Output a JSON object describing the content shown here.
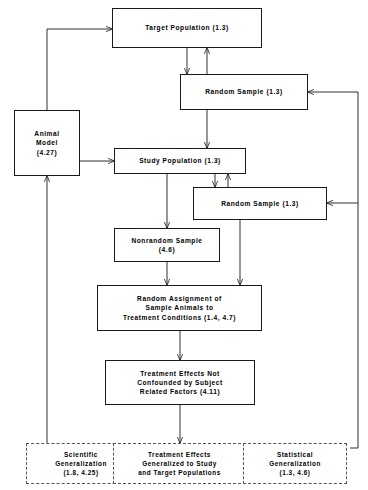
{
  "diagram": {
    "background_color": "#ffffff",
    "line_color": "#1a1a1a",
    "dashed_border_color": "#555555",
    "nodes": [
      {
        "id": "target-population",
        "label": "Target  Population  (1.3)",
        "style": "solid",
        "x": 112,
        "y": 8,
        "w": 150,
        "h": 40
      },
      {
        "id": "random-sample-top",
        "label": "Random  Sample  (1.3)",
        "style": "solid",
        "x": 180,
        "y": 74,
        "w": 128,
        "h": 36
      },
      {
        "id": "animal-model",
        "label": "Animal\nModel\n(4.27)",
        "style": "solid",
        "x": 14,
        "y": 110,
        "w": 66,
        "h": 66
      },
      {
        "id": "study-population",
        "label": "Study  Population  (1.3)",
        "style": "solid",
        "x": 114,
        "y": 148,
        "w": 132,
        "h": 26
      },
      {
        "id": "random-sample-lower",
        "label": "Random  Sample  (1.3)",
        "style": "solid",
        "x": 193,
        "y": 187,
        "w": 134,
        "h": 33
      },
      {
        "id": "nonrandom-sample",
        "label": "Nonrandom  Sample\n(4.6)",
        "style": "solid",
        "x": 114,
        "y": 228,
        "w": 106,
        "h": 34
      },
      {
        "id": "random-assignment",
        "label": "Random  Assignment  of\nSample  Animals  to\nTreatment  Conditions  (1.4,  4.7)",
        "style": "solid",
        "x": 97,
        "y": 285,
        "w": 165,
        "h": 46
      },
      {
        "id": "treatment-effects-not-confounded",
        "label": "Treatment  Effects  Not\nConfounded  by  Subject\nRelated  Factors  (4.11)",
        "style": "solid",
        "x": 105,
        "y": 360,
        "w": 150,
        "h": 45
      },
      {
        "id": "scientific-generalization",
        "label": "Scientific\nGeneralization\n(1.8,  4.25)",
        "style": "dashed",
        "x": 26,
        "y": 443,
        "w": 110,
        "h": 41
      },
      {
        "id": "treatment-effects-generalized",
        "label": "Treatment  Effects\nGeneralized  to  Study\nand  Target  Populations",
        "style": "dashed",
        "x": 113,
        "y": 443,
        "w": 133,
        "h": 41
      },
      {
        "id": "statistical-generalization",
        "label": "Statistical\nGeneralization\n(1.3,  4.6)",
        "style": "dashed",
        "x": 243,
        "y": 443,
        "w": 104,
        "h": 41
      }
    ],
    "connectors": [
      {
        "id": "target-to-random-sample-top",
        "from": "target-population",
        "to": "random-sample-top",
        "direction": "down"
      },
      {
        "id": "random-sample-top-to-target",
        "from": "random-sample-top",
        "to": "target-population",
        "direction": "up"
      },
      {
        "id": "animal-model-to-target",
        "from": "animal-model",
        "to": "target-population",
        "direction": "up-left-elbow"
      },
      {
        "id": "animal-model-to-study-population",
        "from": "animal-model",
        "to": "study-population",
        "direction": "right"
      },
      {
        "id": "random-sample-top-to-study-population",
        "from": "random-sample-top",
        "to": "study-population",
        "direction": "down"
      },
      {
        "id": "study-population-to-random-sample-lower",
        "from": "study-population",
        "to": "random-sample-lower",
        "direction": "down"
      },
      {
        "id": "random-sample-lower-to-study-population",
        "from": "random-sample-lower",
        "to": "study-population",
        "direction": "up"
      },
      {
        "id": "study-population-to-nonrandom-sample",
        "from": "study-population",
        "to": "nonrandom-sample",
        "direction": "down"
      },
      {
        "id": "nonrandom-sample-to-random-assignment",
        "from": "nonrandom-sample",
        "to": "random-assignment",
        "direction": "down"
      },
      {
        "id": "random-sample-lower-to-random-assignment",
        "from": "random-sample-lower",
        "to": "random-assignment",
        "direction": "down"
      },
      {
        "id": "random-assignment-to-treatment-effects",
        "from": "random-assignment",
        "to": "treatment-effects-not-confounded",
        "direction": "down"
      },
      {
        "id": "treatment-effects-to-generalized",
        "from": "treatment-effects-not-confounded",
        "to": "treatment-effects-generalized",
        "direction": "down"
      },
      {
        "id": "scientific-generalization-to-animal-model",
        "from": "scientific-generalization",
        "to": "animal-model",
        "direction": "up"
      },
      {
        "id": "statistical-generalization-to-random-samples",
        "from": "statistical-generalization",
        "to": "random-sample-top",
        "direction": "up-right-elbow"
      }
    ]
  }
}
